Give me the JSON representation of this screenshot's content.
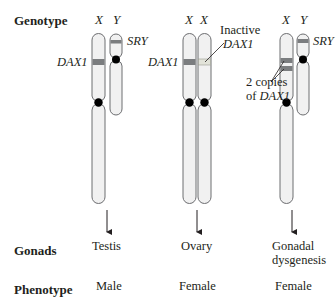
{
  "rows": {
    "genotype": "Genotype",
    "gonads": "Gonads",
    "phenotype": "Phenotype"
  },
  "columns": [
    {
      "chromosomes": [
        "X",
        "Y"
      ],
      "gene_labels": {
        "dax1": "DAX1",
        "sry": "SRY"
      },
      "gonads": "Testis",
      "phenotype": "Male"
    },
    {
      "chromosomes": [
        "X",
        "X"
      ],
      "gene_labels": {
        "dax1": "DAX1"
      },
      "annotation": {
        "line1": "Inactive",
        "line2": "DAX1"
      },
      "gonads": "Ovary",
      "phenotype": "Female"
    },
    {
      "chromosomes": [
        "X",
        "Y"
      ],
      "gene_labels": {
        "sry": "SRY"
      },
      "annotation": {
        "line1": "2 copies",
        "line2_prefix": "of ",
        "line2_gene": "DAX1"
      },
      "gonads_line1": "Gonadal",
      "gonads_line2": "dysgenesis",
      "phenotype": "Female"
    }
  ],
  "colors": {
    "chromosome_fill": "#f1f1f1",
    "chromosome_stroke": "#6d6e71",
    "active_band": "#7b7d7f",
    "inactive_band": "#e2e3d9",
    "centromere": "#000000",
    "text": "#231f20"
  }
}
